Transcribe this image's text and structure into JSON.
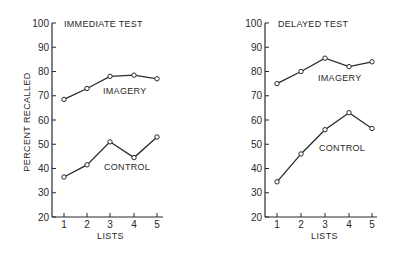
{
  "chart_data": [
    {
      "type": "line",
      "title": "IMMEDIATE TEST",
      "xlabel": "LISTS",
      "ylabel": "PERCENT RECALLED",
      "categories": [
        1,
        2,
        3,
        4,
        5
      ],
      "ylim": [
        20,
        100
      ],
      "yticks": [
        20,
        30,
        40,
        50,
        60,
        70,
        80,
        90,
        100
      ],
      "grid": false,
      "series": [
        {
          "name": "IMAGERY",
          "values": [
            68.5,
            73,
            78,
            78.5,
            77
          ]
        },
        {
          "name": "CONTROL",
          "values": [
            36.5,
            41.5,
            51,
            44.5,
            53
          ]
        }
      ]
    },
    {
      "type": "line",
      "title": "DELAYED TEST",
      "xlabel": "LISTS",
      "ylabel": "",
      "categories": [
        1,
        2,
        3,
        4,
        5
      ],
      "ylim": [
        20,
        100
      ],
      "yticks": [
        20,
        30,
        40,
        50,
        60,
        70,
        80,
        90,
        100
      ],
      "grid": false,
      "series": [
        {
          "name": "IMAGERY",
          "values": [
            75,
            80,
            85.5,
            82,
            84
          ]
        },
        {
          "name": "CONTROL",
          "values": [
            34.5,
            46,
            56,
            63,
            56.5
          ]
        }
      ]
    }
  ],
  "panels": [
    {
      "id": "immediate",
      "title": "IMMEDIATE TEST",
      "ylabel": "PERCENT RECALLED",
      "xlabel": "LISTS",
      "layout": {
        "x0": 52,
        "x1": 163,
        "xticks_px": [
          64,
          87,
          110,
          134,
          157
        ],
        "y20": 217,
        "y100": 23
      },
      "title_pos": [
        64,
        27
      ],
      "series_labels": [
        {
          "text": "IMAGERY",
          "x": 103,
          "y": 94
        },
        {
          "text": "CONTROL",
          "x": 104,
          "y": 170
        }
      ]
    },
    {
      "id": "delayed",
      "title": "DELAYED TEST",
      "ylabel": "",
      "xlabel": "LISTS",
      "layout": {
        "x0": 265,
        "x1": 377,
        "xticks_px": [
          277,
          301,
          325,
          349,
          372
        ],
        "y20": 217,
        "y100": 23
      },
      "title_pos": [
        278,
        27
      ],
      "series_labels": [
        {
          "text": "IMAGERY",
          "x": 318,
          "y": 81
        },
        {
          "text": "CONTROL",
          "x": 319,
          "y": 151
        }
      ]
    }
  ]
}
